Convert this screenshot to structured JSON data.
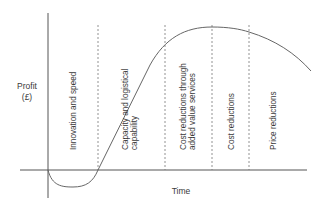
{
  "diagram": {
    "y_axis_label_line1": "Profit",
    "y_axis_label_line2": "(£)",
    "x_axis_label": "Time",
    "phases": [
      {
        "label_line1": "Innovation and speed",
        "label_line2": ""
      },
      {
        "label_line1": "Capacity and logistical",
        "label_line2": "capability"
      },
      {
        "label_line1": "Cost reductions through",
        "label_line2": "added value services"
      },
      {
        "label_line1": "Cost reductions",
        "label_line2": ""
      },
      {
        "label_line1": "Price reductions",
        "label_line2": ""
      }
    ],
    "colors": {
      "axis": "#555555",
      "curve": "#666666",
      "divider": "#777777",
      "text": "#3a3a3a"
    }
  }
}
